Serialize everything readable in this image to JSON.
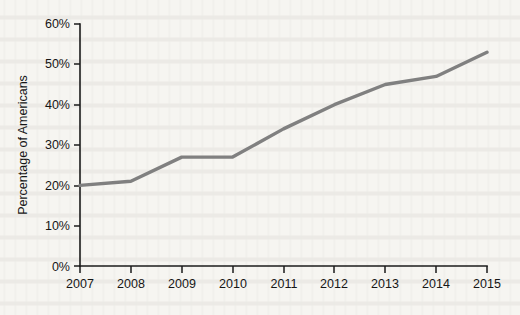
{
  "chart_data": {
    "type": "line",
    "title": "",
    "subtitle": "",
    "xlabel": "",
    "ylabel": "Percentage of Americans",
    "categories": [
      "2007",
      "2008",
      "2009",
      "2010",
      "2011",
      "2012",
      "2013",
      "2014",
      "2015"
    ],
    "x": [
      2007,
      2008,
      2009,
      2010,
      2011,
      2012,
      2013,
      2014,
      2015
    ],
    "values": [
      20,
      21,
      27,
      27,
      34,
      40,
      45,
      47,
      53
    ],
    "series": [
      {
        "name": "Percentage of Americans",
        "values": [
          20,
          21,
          27,
          27,
          34,
          40,
          45,
          47,
          53
        ],
        "color": "#808080"
      }
    ],
    "xlim": [
      2007,
      2015
    ],
    "ylim": [
      0,
      60
    ],
    "ytick_values": [
      0,
      10,
      20,
      30,
      40,
      50,
      60
    ],
    "ytick_labels": [
      "0%",
      "10%",
      "20%",
      "30%",
      "40%",
      "50%",
      "60%"
    ],
    "xtick_labels": [
      "2007",
      "2008",
      "2009",
      "2010",
      "2011",
      "2012",
      "2013",
      "2014",
      "2015"
    ],
    "grid": false,
    "legend": false,
    "legend_position": "none",
    "annotations": [],
    "line_color": "#808080",
    "axis_color": "#1b1b1b",
    "background_color": "#f6f5f1"
  },
  "figure": {
    "y_axis_title": "Percentage of Americans"
  }
}
